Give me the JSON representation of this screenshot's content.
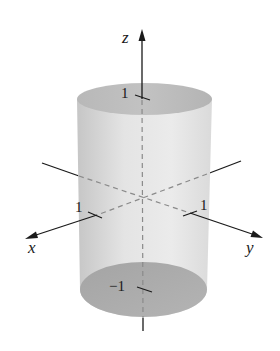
{
  "figure": {
    "type": "3d-cylinder-diagram",
    "axes": {
      "x": {
        "label": "x",
        "tick_label": "1"
      },
      "y": {
        "label": "y",
        "tick_label": "1"
      },
      "z": {
        "label": "z",
        "tick_top_label": "1",
        "tick_bottom_label": "−1"
      }
    },
    "colors": {
      "background": "#ffffff",
      "axis": "#1a1a1a",
      "hidden_axis": "#8a8a8a",
      "side_light": "#e6e6e6",
      "side_dark": "#c4c4c4",
      "top_face": "#bdbdbd",
      "bottom_face": "#a9a9a9"
    }
  }
}
